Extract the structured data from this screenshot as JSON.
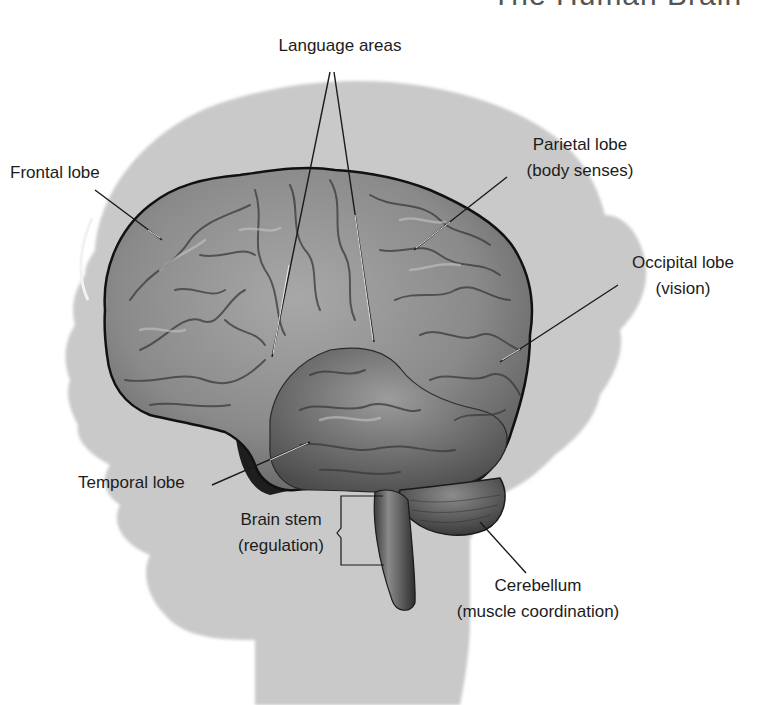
{
  "figure": {
    "title": "The Human Brain",
    "colors": {
      "background": "#ffffff",
      "head_silhouette": "#c9c9c9",
      "brain_fill": "#8f8f8f",
      "brain_outline": "#111111",
      "text": "#1c1c1c",
      "leader_line": "#1a1a1a"
    }
  },
  "labels": {
    "language_areas": {
      "line1": "Language areas"
    },
    "frontal_lobe": {
      "line1": "Frontal lobe"
    },
    "parietal_lobe": {
      "line1": "Parietal lobe",
      "line2": "(body senses)"
    },
    "occipital_lobe": {
      "line1": "Occipital lobe",
      "line2": "(vision)"
    },
    "temporal_lobe": {
      "line1": "Temporal lobe"
    },
    "brain_stem": {
      "line1": "Brain stem",
      "line2": "(regulation)"
    },
    "cerebellum": {
      "line1": "Cerebellum",
      "line2": "(muscle coordination)"
    }
  }
}
